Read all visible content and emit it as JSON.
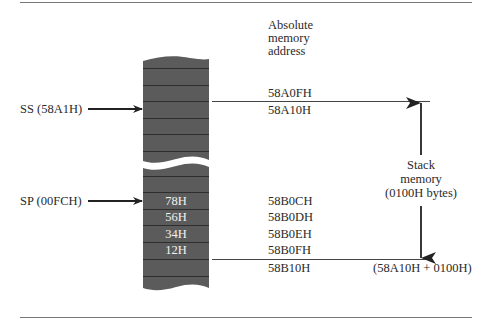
{
  "header": {
    "column_title_lines": [
      "Absolute",
      "memory",
      "address"
    ]
  },
  "registers": {
    "ss_label": "SS (58A1H)",
    "sp_label": "SP (00FCH)"
  },
  "stack_cells": [
    {
      "value": "78H",
      "address": "58B0CH"
    },
    {
      "value": "56H",
      "address": "58B0DH"
    },
    {
      "value": "34H",
      "address": "58B0EH"
    },
    {
      "value": "12H",
      "address": "58B0FH"
    }
  ],
  "boundaries": {
    "top_before": "58A0FH",
    "top_start": "58A10H",
    "bottom_end": "58B10H",
    "bottom_formula": "(58A10H + 0100H)"
  },
  "stack_size_label": {
    "line1": "Stack",
    "line2": "memory",
    "line3": "(0100H bytes)"
  },
  "colors": {
    "memory_fill": "#5b5b5b",
    "row_line": "#2e2e2e",
    "ink": "#222222"
  }
}
